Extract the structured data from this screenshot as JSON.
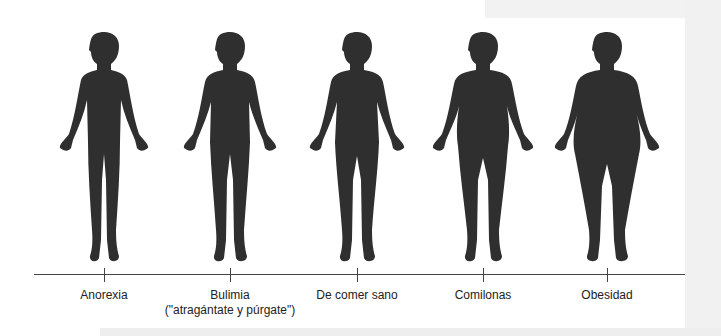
{
  "diagram": {
    "type": "spectrum",
    "axis_color": "#444444",
    "silhouette_color": "#2f2f2f",
    "categories": [
      {
        "label": "Anorexia",
        "sublabel": "",
        "x": 104,
        "body_width": 0.72
      },
      {
        "label": "Bulimia",
        "sublabel": "(\"atragántate y púrgate\")",
        "x": 230,
        "body_width": 0.85
      },
      {
        "label": "De comer sano",
        "sublabel": "",
        "x": 357,
        "body_width": 0.92
      },
      {
        "label": "Comilonas",
        "sublabel": "",
        "x": 483,
        "body_width": 1.05
      },
      {
        "label": "Obesidad",
        "sublabel": "",
        "x": 607,
        "body_width": 1.25
      }
    ]
  }
}
